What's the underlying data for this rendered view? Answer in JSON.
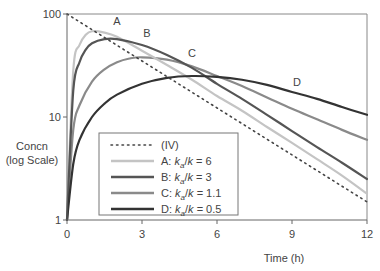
{
  "chart_data": {
    "type": "line",
    "title": "",
    "xlabel": "Time (h)",
    "ylabel": "Concn\n(log Scale)",
    "ylabel_lines": [
      "Concn",
      "(log Scale)"
    ],
    "xlim": [
      0,
      12
    ],
    "ylim": [
      1,
      100
    ],
    "yscale": "log",
    "x_ticks": [
      0,
      3,
      6,
      9,
      12
    ],
    "x_tick_labels": [
      "0",
      "3",
      "6",
      "9",
      "12"
    ],
    "y_ticks": [
      1,
      10,
      100
    ],
    "y_tick_labels": [
      "1",
      "10",
      "100"
    ],
    "grid": false,
    "legend_position": "lower-left-inside",
    "series": [
      {
        "name": "(IV)",
        "legend_label": "(IV)",
        "curve_label": "",
        "style": "dotted",
        "color": "#444444",
        "x": [
          0,
          1,
          2,
          3,
          4,
          5,
          6,
          7,
          8,
          9,
          10,
          11,
          12
        ],
        "values": [
          100,
          70.5,
          49.7,
          35.0,
          24.7,
          17.4,
          12.3,
          8.66,
          6.1,
          4.3,
          3.03,
          2.14,
          1.5
        ]
      },
      {
        "name": "A",
        "legend_label": "A: ka/k = 6",
        "legend_parts": [
          "A: ",
          "k",
          "a",
          "/",
          "k",
          " = 6"
        ],
        "curve_label": "A",
        "style": "solid",
        "color": "#c4c4c4",
        "x": [
          0,
          0.25,
          0.5,
          0.75,
          1,
          1.5,
          2,
          3,
          4,
          5,
          6,
          7,
          8,
          9,
          10,
          11,
          12
        ],
        "values": [
          1,
          28,
          50,
          63,
          68,
          66,
          60,
          44,
          32,
          23,
          16,
          11.5,
          8.0,
          5.6,
          3.9,
          2.7,
          1.8
        ]
      },
      {
        "name": "B",
        "legend_label": "B: ka/k = 3",
        "legend_parts": [
          "B: ",
          "k",
          "a",
          "/",
          "k",
          " = 3"
        ],
        "curve_label": "B",
        "style": "solid",
        "color": "#555555",
        "x": [
          0,
          0.25,
          0.5,
          0.75,
          1,
          1.5,
          2,
          3,
          4,
          5,
          6,
          7,
          8,
          9,
          10,
          11,
          12
        ],
        "values": [
          1,
          18,
          34,
          45,
          52,
          57,
          57,
          50,
          40,
          30,
          21,
          15,
          10.5,
          7.3,
          5.1,
          3.6,
          2.5
        ]
      },
      {
        "name": "C",
        "legend_label": "C: ka/k = 1.1",
        "legend_parts": [
          "C: ",
          "k",
          "a",
          "/",
          "k",
          " = 1.1"
        ],
        "curve_label": "C",
        "style": "solid",
        "color": "#8a8a8a",
        "x": [
          0,
          0.25,
          0.5,
          1,
          1.5,
          2,
          2.5,
          3,
          4,
          5,
          6,
          7,
          8,
          9,
          10,
          11,
          12
        ],
        "values": [
          1,
          7.5,
          13,
          22,
          29,
          34,
          37,
          38,
          36,
          31,
          25,
          20,
          15.5,
          12,
          9.5,
          7.5,
          6
        ]
      },
      {
        "name": "D",
        "legend_label": "D: ka/k = 0.5",
        "legend_parts": [
          "D: ",
          "k",
          "a",
          "/",
          "k",
          " = 0.5"
        ],
        "curve_label": "D",
        "style": "solid",
        "color": "#333333",
        "x": [
          0,
          0.25,
          0.5,
          1,
          1.5,
          2,
          3,
          4,
          5,
          6,
          7,
          8,
          9,
          10,
          11,
          12
        ],
        "values": [
          1,
          3.5,
          6,
          10,
          13.5,
          16.5,
          21,
          24,
          25,
          24.5,
          23,
          20.5,
          17.5,
          15,
          12.5,
          10.5
        ]
      }
    ],
    "annotations": [
      {
        "text": "A",
        "x": 2.0,
        "y": 78
      },
      {
        "text": "B",
        "x": 3.2,
        "y": 60
      },
      {
        "text": "C",
        "x": 5.0,
        "y": 38
      },
      {
        "text": "D",
        "x": 9.2,
        "y": 20
      }
    ]
  },
  "layout": {
    "plot_left": 67,
    "plot_right": 367,
    "plot_top": 14,
    "plot_bottom": 220
  }
}
